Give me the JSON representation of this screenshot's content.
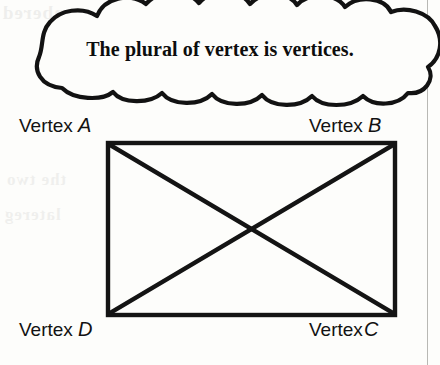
{
  "figure": {
    "callout": {
      "text": "The plural of vertex is vertices.",
      "shape": "thought-cloud"
    },
    "shape_name": "rectangle",
    "vertices": [
      {
        "id": "A",
        "label_prefix": "Vertex",
        "letter": "A",
        "position": "top-left"
      },
      {
        "id": "B",
        "label_prefix": "Vertex",
        "letter": "B",
        "position": "top-right"
      },
      {
        "id": "C",
        "label_prefix": "Vertex",
        "letter": "C",
        "position": "bottom-right"
      },
      {
        "id": "D",
        "label_prefix": "Vertex",
        "letter": "D",
        "position": "bottom-left"
      }
    ],
    "diagonals": [
      "A-C",
      "B-D"
    ],
    "colors": {
      "ink": "#0d0d0d",
      "paper": "#fdfdfb",
      "rule": "#b8b8b4"
    }
  },
  "ghost_text": {
    "top": "nbered",
    "mid1": "the two",
    "mid2": "latereg"
  }
}
